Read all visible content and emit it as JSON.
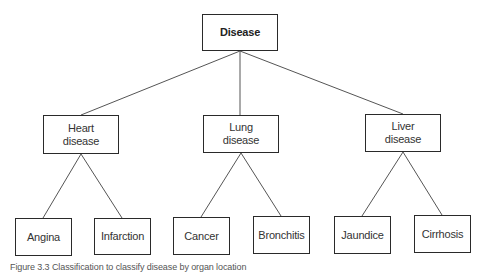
{
  "diagram": {
    "type": "tree",
    "root": {
      "id": "disease",
      "label": "Disease",
      "box": {
        "x": 202,
        "y": 14,
        "w": 76,
        "h": 37
      }
    },
    "level1": [
      {
        "id": "heart",
        "label": "Heart\ndisease",
        "box": {
          "x": 43,
          "y": 115,
          "w": 76,
          "h": 39
        }
      },
      {
        "id": "lung",
        "label": "Lung\ndisease",
        "box": {
          "x": 203,
          "y": 115,
          "w": 76,
          "h": 38
        }
      },
      {
        "id": "liver",
        "label": "Liver\ndisease",
        "box": {
          "x": 365,
          "y": 114,
          "w": 76,
          "h": 38
        }
      }
    ],
    "level2": [
      {
        "id": "angina",
        "parent": "heart",
        "label": "Angina",
        "box": {
          "x": 15,
          "y": 218,
          "w": 57,
          "h": 38
        }
      },
      {
        "id": "infarction",
        "parent": "heart",
        "label": "Infarction",
        "box": {
          "x": 94,
          "y": 218,
          "w": 57,
          "h": 37
        }
      },
      {
        "id": "cancer",
        "parent": "lung",
        "label": "Cancer",
        "box": {
          "x": 173,
          "y": 217,
          "w": 57,
          "h": 38
        }
      },
      {
        "id": "bronchitis",
        "parent": "lung",
        "label": "Bronchitis",
        "box": {
          "x": 253,
          "y": 216,
          "w": 57,
          "h": 38
        }
      },
      {
        "id": "jaundice",
        "parent": "liver",
        "label": "Jaundice",
        "box": {
          "x": 334,
          "y": 216,
          "w": 57,
          "h": 38
        }
      },
      {
        "id": "cirrhosis",
        "parent": "liver",
        "label": "Cirrhosis",
        "box": {
          "x": 414,
          "y": 215,
          "w": 57,
          "h": 38
        }
      }
    ],
    "edges": [
      {
        "from": "disease",
        "to": "heart",
        "x1": 240,
        "y1": 51,
        "x2": 81,
        "y2": 115
      },
      {
        "from": "disease",
        "to": "lung",
        "x1": 240,
        "y1": 51,
        "x2": 240,
        "y2": 115
      },
      {
        "from": "disease",
        "to": "liver",
        "x1": 240,
        "y1": 51,
        "x2": 403,
        "y2": 114
      },
      {
        "from": "heart",
        "to": "angina",
        "x1": 81,
        "y1": 154,
        "x2": 43,
        "y2": 218
      },
      {
        "from": "heart",
        "to": "infarction",
        "x1": 81,
        "y1": 154,
        "x2": 122,
        "y2": 218
      },
      {
        "from": "lung",
        "to": "cancer",
        "x1": 241,
        "y1": 153,
        "x2": 201,
        "y2": 217
      },
      {
        "from": "lung",
        "to": "bronchitis",
        "x1": 241,
        "y1": 153,
        "x2": 281,
        "y2": 216
      },
      {
        "from": "liver",
        "to": "jaundice",
        "x1": 403,
        "y1": 152,
        "x2": 362,
        "y2": 216
      },
      {
        "from": "liver",
        "to": "cirrhosis",
        "x1": 403,
        "y1": 152,
        "x2": 442,
        "y2": 215
      }
    ],
    "colors": {
      "border": "#2a2a2a",
      "edge": "#555555",
      "text": "#333333",
      "background": "#ffffff"
    }
  },
  "caption": "Figure 3.3  Classification to classify disease by organ location"
}
